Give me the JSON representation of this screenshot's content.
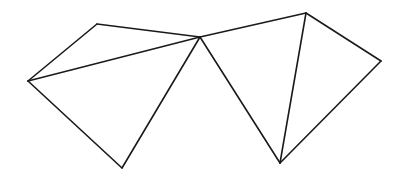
{
  "diagram": {
    "type": "line-drawing",
    "stroke_color": "#1a1a1a",
    "background": "#ffffff",
    "vertices": {
      "A": [
        28,
        81
      ],
      "B": [
        97,
        24
      ],
      "C": [
        200,
        37
      ],
      "D": [
        122,
        168
      ],
      "E": [
        306,
        13
      ],
      "F": [
        381,
        61
      ],
      "G": [
        280,
        163
      ]
    },
    "edges": [
      [
        "A",
        "B"
      ],
      [
        "B",
        "C"
      ],
      [
        "A",
        "C"
      ],
      [
        "A",
        "D"
      ],
      [
        "D",
        "C"
      ],
      [
        "C",
        "E"
      ],
      [
        "C",
        "G"
      ],
      [
        "E",
        "G"
      ],
      [
        "E",
        "F"
      ],
      [
        "F",
        "G"
      ]
    ]
  }
}
